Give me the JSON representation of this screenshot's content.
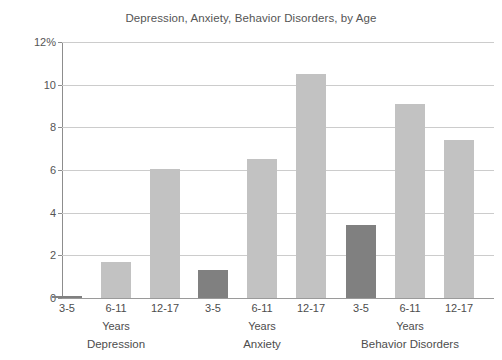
{
  "chart_data": {
    "type": "bar",
    "title": "Depression, Anxiety, Behavior Disorders, by Age",
    "xlabel": "",
    "ylabel": "",
    "ylim": [
      0,
      12
    ],
    "ytick_values": [
      0,
      2,
      4,
      6,
      8,
      10,
      12
    ],
    "ytick_labels": [
      "0",
      "2",
      "4",
      "6",
      "8",
      "10",
      "12%"
    ],
    "grid": true,
    "legend": "none",
    "categories": [
      "3-5",
      "6-11",
      "12-17"
    ],
    "group_axis_label": "Years",
    "groups": [
      {
        "name": "Depression",
        "bars": [
          {
            "category": "3-5",
            "value": 0.1,
            "color": "#808080"
          },
          {
            "category": "6-11",
            "value": 1.7,
            "color": "#c2c2c2"
          },
          {
            "category": "12-17",
            "value": 6.05,
            "color": "#c2c2c2"
          }
        ]
      },
      {
        "name": "Anxiety",
        "bars": [
          {
            "category": "3-5",
            "value": 1.3,
            "color": "#808080"
          },
          {
            "category": "6-11",
            "value": 6.5,
            "color": "#c2c2c2"
          },
          {
            "category": "12-17",
            "value": 10.5,
            "color": "#c2c2c2"
          }
        ]
      },
      {
        "name": "Behavior Disorders",
        "bars": [
          {
            "category": "3-5",
            "value": 3.4,
            "color": "#808080"
          },
          {
            "category": "6-11",
            "value": 9.1,
            "color": "#c2c2c2"
          },
          {
            "category": "12-17",
            "value": 7.4,
            "color": "#c2c2c2"
          }
        ]
      }
    ],
    "colors": {
      "bar_light": "#c2c2c2",
      "bar_dark": "#808080",
      "gridline": "#cccccc",
      "axis": "#8d8d8d",
      "text": "#4d4d4d",
      "background": "#ffffff"
    }
  }
}
